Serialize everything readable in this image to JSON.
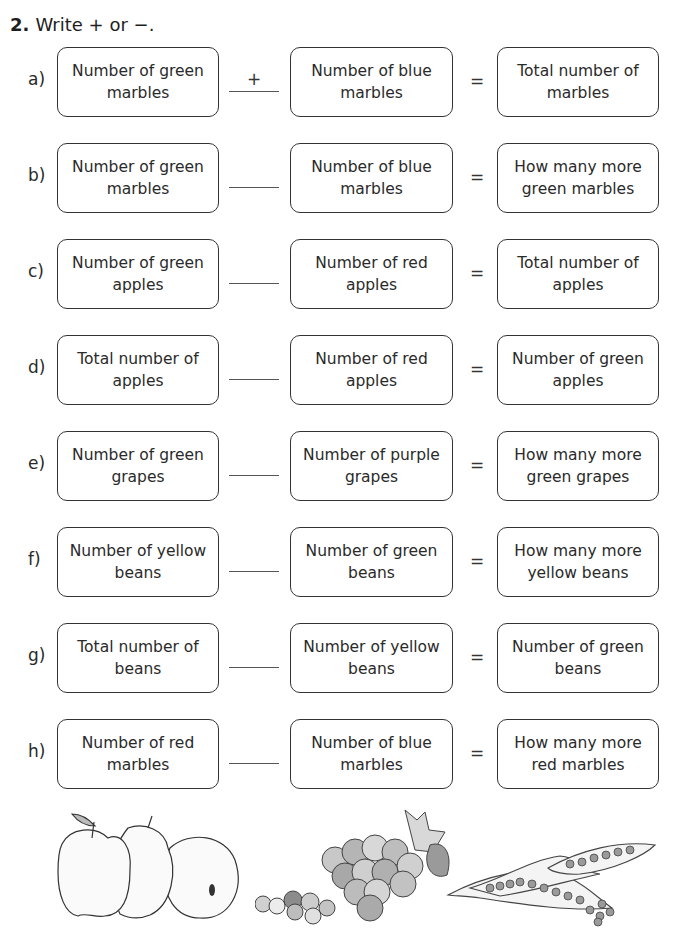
{
  "question": {
    "number": "2.",
    "instruction": "Write + or −."
  },
  "rows": [
    {
      "label": "a)",
      "left": "Number of green marbles",
      "operator": "+",
      "middle": "Number of blue marbles",
      "equals": "=",
      "right": "Total number of marbles"
    },
    {
      "label": "b)",
      "left": "Number of green marbles",
      "operator": "",
      "middle": "Number of blue marbles",
      "equals": "=",
      "right": "How many more green marbles"
    },
    {
      "label": "c)",
      "left": "Number of green apples",
      "operator": "",
      "middle": "Number of red apples",
      "equals": "=",
      "right": "Total number of apples"
    },
    {
      "label": "d)",
      "left": "Total number of apples",
      "operator": "",
      "middle": "Number of red apples",
      "equals": "=",
      "right": "Number of green apples"
    },
    {
      "label": "e)",
      "left": "Number of green grapes",
      "operator": "",
      "middle": "Number of purple grapes",
      "equals": "=",
      "right": "How many more green grapes"
    },
    {
      "label": "f)",
      "left": "Number of yellow beans",
      "operator": "",
      "middle": "Number of green beans",
      "equals": "=",
      "right": "How many more yellow beans"
    },
    {
      "label": "g)",
      "left": "Total number of beans",
      "operator": "",
      "middle": "Number of yellow beans",
      "equals": "=",
      "right": "Number of green beans"
    },
    {
      "label": "h)",
      "left": "Number of red marbles",
      "operator": "",
      "middle": "Number of blue marbles",
      "equals": "=",
      "right": "How many more red marbles"
    }
  ],
  "illustrations": [
    "apples-icon",
    "grapes-icon",
    "pea-pods-icon"
  ]
}
